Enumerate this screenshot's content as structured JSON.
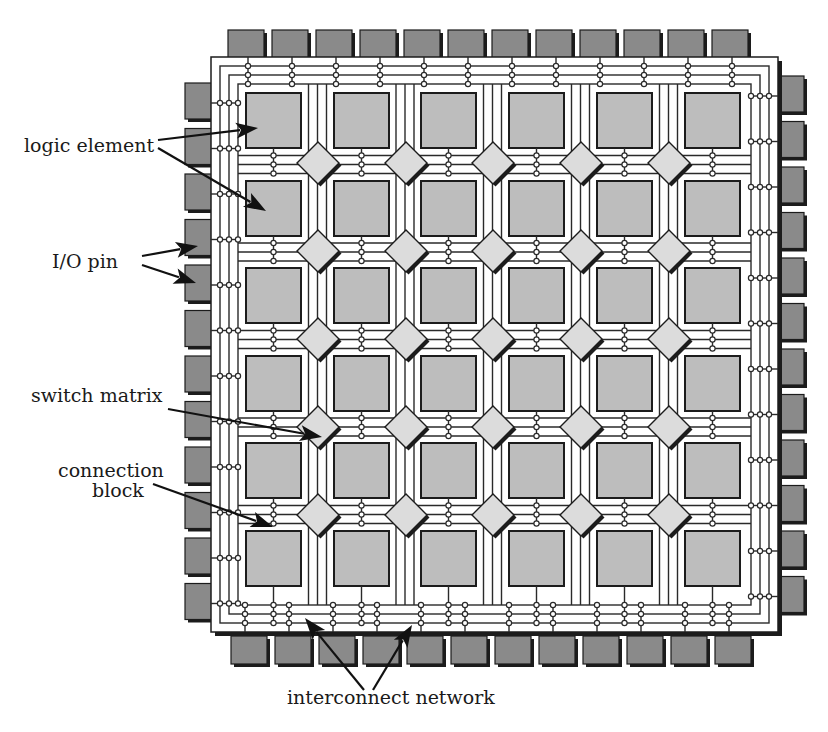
{
  "colors": {
    "io_pin": "#8a8a8a",
    "logic_element": "#bdbdbd",
    "switch_matrix": "#dcdcdc",
    "line": "#1c1c1c",
    "background": "#ffffff"
  },
  "chip": {
    "x": 211,
    "y": 57,
    "w": 567,
    "h": 575,
    "grid_cols": 6,
    "grid_rows": 6,
    "block_x": [
      246,
      334,
      421,
      509,
      597,
      685
    ],
    "block_y": [
      93,
      181,
      268,
      356,
      443,
      531
    ],
    "block_size": 55,
    "switch_x": [
      318,
      406,
      493,
      581,
      669
    ],
    "switch_y": [
      163,
      251,
      339,
      427,
      515
    ],
    "switch_half_diag": 21,
    "tracks_per_channel": 3,
    "track_spacing": 9
  },
  "io_pins": {
    "count_per_side": 12,
    "top": {
      "x_start": 228,
      "pitch": 44,
      "y": 30,
      "w": 36,
      "h": 28
    },
    "bottom": {
      "x_start": 231,
      "pitch": 44,
      "y": 636,
      "w": 36,
      "h": 28
    },
    "left": {
      "y_start": 83,
      "pitch": 45.5,
      "x": 185,
      "w": 27,
      "h": 36
    },
    "right": {
      "y_start": 76,
      "pitch": 45.5,
      "x": 777,
      "w": 27,
      "h": 36
    }
  },
  "labels": [
    {
      "id": "logic-element",
      "text": "logic element",
      "x": 24,
      "y": 152,
      "anchor": "start"
    },
    {
      "id": "io-pin",
      "text": "I/O pin",
      "x": 52,
      "y": 268,
      "anchor": "start"
    },
    {
      "id": "switch-matrix",
      "text": "switch matrix",
      "x": 31,
      "y": 402,
      "anchor": "start"
    },
    {
      "id": "connection-block-1",
      "text": "connection",
      "x": 58,
      "y": 477,
      "anchor": "start"
    },
    {
      "id": "connection-block-2",
      "text": "block",
      "x": 92,
      "y": 497,
      "anchor": "start"
    },
    {
      "id": "interconnect-network",
      "text": "interconnect network",
      "x": 287,
      "y": 704,
      "anchor": "start"
    }
  ],
  "arrows": [
    {
      "target": "logic-element",
      "x1": 158,
      "y1": 140,
      "x2": 258,
      "y2": 128
    },
    {
      "target": "logic-element",
      "x1": 158,
      "y1": 148,
      "x2": 266,
      "y2": 211
    },
    {
      "target": "io-pin",
      "x1": 142,
      "y1": 256,
      "x2": 198,
      "y2": 246
    },
    {
      "target": "io-pin",
      "x1": 142,
      "y1": 265,
      "x2": 196,
      "y2": 283
    },
    {
      "target": "switch-matrix",
      "x1": 168,
      "y1": 409,
      "x2": 322,
      "y2": 437
    },
    {
      "target": "connection-block",
      "x1": 153,
      "y1": 484,
      "x2": 273,
      "y2": 527
    },
    {
      "target": "interconnect-network",
      "x1": 364,
      "y1": 690,
      "x2": 305,
      "y2": 618
    },
    {
      "target": "interconnect-network",
      "x1": 373,
      "y1": 690,
      "x2": 412,
      "y2": 625
    }
  ]
}
